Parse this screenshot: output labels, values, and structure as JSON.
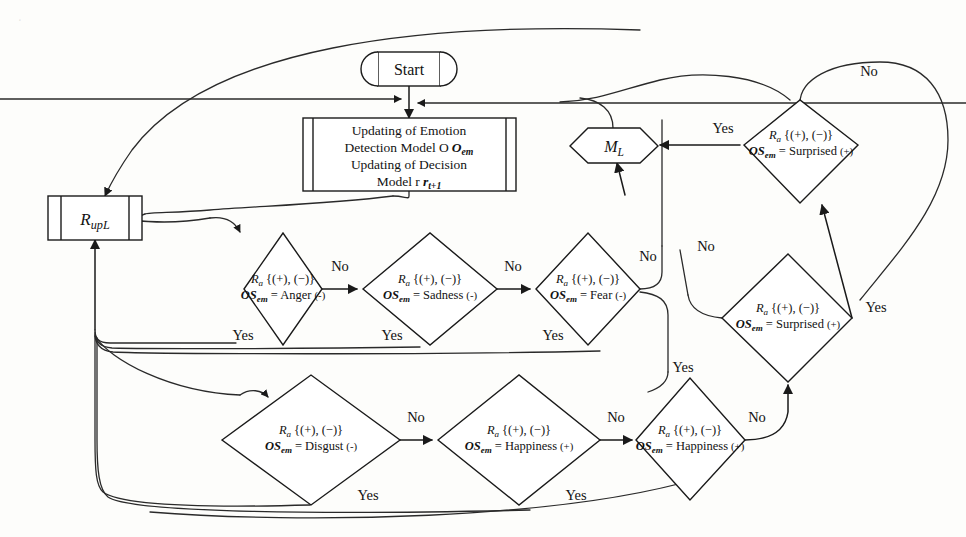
{
  "figure": {
    "type": "flowchart"
  },
  "nodes": {
    "start": {
      "label": "Start",
      "shape": "terminator"
    },
    "process": {
      "shape": "process",
      "lines": [
        "Updating of Emotion",
        "Detection Model O",
        "Updating of Decision",
        "Model r"
      ],
      "line2_sub": "em",
      "line4_sub": "t+1"
    },
    "rupl": {
      "label": "R",
      "sub": "upL",
      "shape": "subroutine"
    },
    "ml": {
      "label": "M",
      "sub": "L",
      "shape": "hexagon"
    },
    "anger": {
      "top": "R",
      "top_sub": "a",
      "top_set": "{(+), (−)}",
      "bot_lead": "OS",
      "bot_sub": "em",
      "bot_eq": "= Anger",
      "bot_sign": "(-)"
    },
    "sadness": {
      "top": "R",
      "top_sub": "a",
      "top_set": "{(+), (−)}",
      "bot_lead": "OS",
      "bot_sub": "em",
      "bot_eq": "= Sadness",
      "bot_sign": "(-)"
    },
    "fear": {
      "top": "R",
      "top_sub": "a",
      "top_set": "{(+), (−)}",
      "bot_lead": "OS",
      "bot_sub": "em",
      "bot_eq": "= Fear",
      "bot_sign": "(-)"
    },
    "disgust": {
      "top": "R",
      "top_sub": "a",
      "top_set": "{(+), (−)}",
      "bot_lead": "OS",
      "bot_sub": "em",
      "bot_eq": "= Disgust",
      "bot_sign": "(-)"
    },
    "happiness1": {
      "top": "R",
      "top_sub": "a",
      "top_set": "{(+), (−)}",
      "bot_lead": "OS",
      "bot_sub": "em",
      "bot_eq": "= Happiness",
      "bot_sign": "(+)"
    },
    "happiness2": {
      "top": "R",
      "top_sub": "a",
      "top_set": "{(+), (−)}",
      "bot_lead": "OS",
      "bot_sub": "em",
      "bot_eq": "= Happiness",
      "bot_sign": "(+)"
    },
    "surprised_top": {
      "top": "R",
      "top_sub": "a",
      "top_set": "{(+), (−)}",
      "bot_lead": "OS",
      "bot_sub": "em",
      "bot_eq": "= Surprised",
      "bot_sign": "(+)"
    },
    "surprised_bottom": {
      "top": "R",
      "top_sub": "a",
      "top_set": "{(+), (−)}",
      "bot_lead": "OS",
      "bot_sub": "em",
      "bot_eq": "= Surprised",
      "bot_sign": "(+)"
    }
  },
  "branch_labels": {
    "anger_no": "No",
    "anger_yes": "Yes",
    "sadness_no": "No",
    "sadness_yes": "Yes",
    "fear_no": "No",
    "fear_yes": "Yes",
    "disgust_no": "No",
    "disgust_yes": "Yes",
    "happiness1_no": "No",
    "happiness1_yes": "Yes",
    "happiness2_no": "No",
    "surprised_top_no": "No",
    "surprised_top_yes": "Yes",
    "surprised_bottom_no": "No",
    "surprised_bottom_yes": "Yes"
  },
  "colors": {
    "ink": "#1a1a1a",
    "paper": "#fdfdfb"
  }
}
